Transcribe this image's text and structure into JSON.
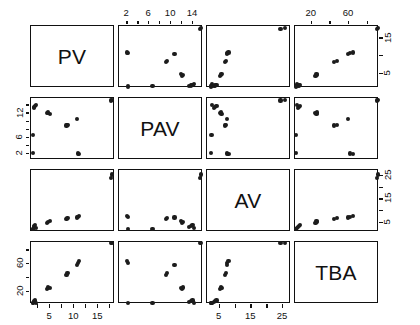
{
  "figure": {
    "type": "scatterplot-matrix",
    "background_color": "#ffffff",
    "point_color": "#1c1c1c",
    "axis_color": "#111111"
  },
  "variables": [
    {
      "key": "PV",
      "label": "PV",
      "range": [
        1.0,
        18.5
      ],
      "bottom_ticks": [
        5,
        10,
        15
      ],
      "bottom_minor": [
        2.5,
        7.5,
        12.5,
        17.5
      ]
    },
    {
      "key": "PAV",
      "label": "PAV",
      "range": [
        0.5,
        15.8
      ],
      "top_ticks": [
        2,
        6,
        10,
        14
      ],
      "left_ticks": [
        2,
        6,
        12
      ],
      "top_minor": [
        4,
        8,
        12
      ]
    },
    {
      "key": "AV",
      "label": "AV",
      "range": [
        1.0,
        27.5
      ],
      "bottom_ticks": [
        5,
        15,
        25
      ],
      "right_ticks": [
        5,
        15,
        25
      ],
      "bottom_minor": [
        10,
        20
      ]
    },
    {
      "key": "TBA",
      "label": "TBA",
      "range": [
        2.0,
        92.0
      ],
      "top_ticks": [
        20,
        60
      ],
      "left_ticks": [
        20,
        60
      ],
      "top_minor": [
        40,
        80
      ]
    }
  ],
  "chart_data": {
    "type": "scatter",
    "title": "",
    "subtitle": "",
    "xlabel": "",
    "ylabel": "",
    "grid": false,
    "legend": "none",
    "layout": "4x4 pairs matrix, diagonal shows variable name",
    "diagonal_labels": [
      "PV",
      "PAV",
      "AV",
      "TBA"
    ],
    "axis_placement": {
      "PV": {
        "bottom": [
          5,
          10,
          15
        ]
      },
      "PAV": {
        "top": [
          2,
          6,
          10,
          14
        ],
        "left": [
          2,
          6,
          12
        ]
      },
      "AV": {
        "bottom": [
          5,
          15,
          25
        ],
        "right": [
          5,
          15,
          25
        ]
      },
      "TBA": {
        "top": [
          20,
          60
        ],
        "left": [
          20,
          60
        ]
      }
    },
    "axis_ranges": {
      "PV": [
        1.0,
        18.5
      ],
      "PAV": [
        0.5,
        15.8
      ],
      "AV": [
        1.0,
        27.5
      ],
      "TBA": [
        2.0,
        92.0
      ]
    },
    "observations": [
      {
        "PV": 1.6,
        "PAV": 13.3,
        "AV": 3.2,
        "TBA": 5.0
      },
      {
        "PV": 1.7,
        "PAV": 13.6,
        "AV": 3.6,
        "TBA": 6.0
      },
      {
        "PV": 1.9,
        "PAV": 13.9,
        "AV": 4.0,
        "TBA": 7.0
      },
      {
        "PV": 2.1,
        "PAV": 14.1,
        "AV": 2.6,
        "TBA": 4.0
      },
      {
        "PV": 1.5,
        "PAV": 6.6,
        "AV": 2.4,
        "TBA": 3.5
      },
      {
        "PV": 1.4,
        "PAV": 2.2,
        "AV": 2.2,
        "TBA": 3.0
      },
      {
        "PV": 4.3,
        "PAV": 12.0,
        "AV": 5.0,
        "TBA": 24.0
      },
      {
        "PV": 4.6,
        "PAV": 12.2,
        "AV": 5.3,
        "TBA": 26.0
      },
      {
        "PV": 4.9,
        "PAV": 11.8,
        "AV": 5.6,
        "TBA": 25.0
      },
      {
        "PV": 8.4,
        "PAV": 9.0,
        "AV": 6.6,
        "TBA": 44.0
      },
      {
        "PV": 8.6,
        "PAV": 9.2,
        "AV": 6.9,
        "TBA": 47.0
      },
      {
        "PV": 10.8,
        "PAV": 2.1,
        "AV": 7.4,
        "TBA": 61.0
      },
      {
        "PV": 11.0,
        "PAV": 2.0,
        "AV": 7.8,
        "TBA": 64.0
      },
      {
        "PV": 10.6,
        "PAV": 10.6,
        "AV": 7.2,
        "TBA": 59.0
      },
      {
        "PV": 17.6,
        "PAV": 15.2,
        "AV": 24.2,
        "TBA": 90.0
      },
      {
        "PV": 17.9,
        "PAV": 15.4,
        "AV": 25.6,
        "TBA": 91.0
      }
    ]
  }
}
